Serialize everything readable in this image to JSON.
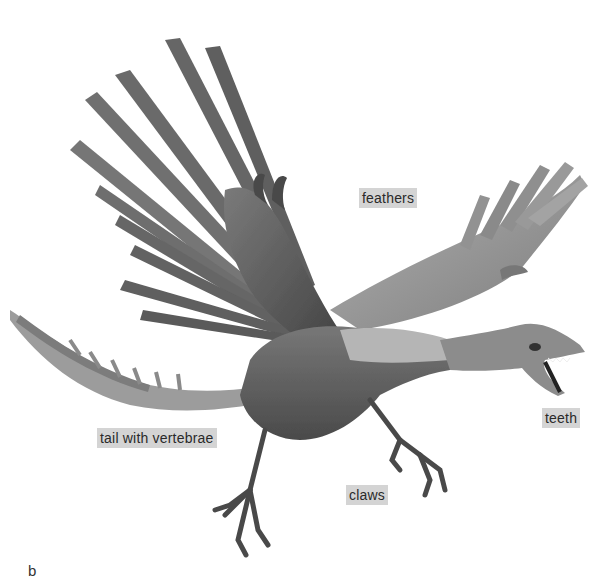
{
  "figure": {
    "panel_letter": "b",
    "labels": {
      "feathers": "feathers",
      "teeth": "teeth",
      "tail": "tail with vertebrae",
      "claws": "claws"
    },
    "colors": {
      "label_bg": "#d4d4d4",
      "label_text": "#2a2a2a",
      "wing_dark": "#555555",
      "wing_light": "#9a9a9a",
      "body": "#6b6b6b",
      "background": "#ffffff"
    }
  }
}
